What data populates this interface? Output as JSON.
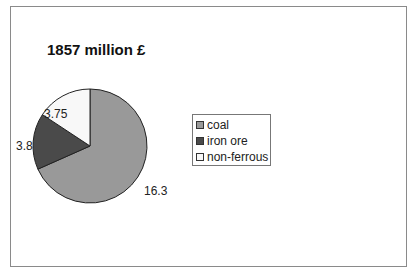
{
  "chart_data": {
    "type": "pie",
    "title": "1857 million £",
    "categories": [
      "coal",
      "iron ore",
      "non-ferrous"
    ],
    "values": [
      16.3,
      3.8,
      3.75
    ],
    "colors": [
      "#999999",
      "#4a4a4a",
      "#f8f8f8"
    ],
    "data_labels": [
      "16.3",
      "3.8",
      "3.75"
    ],
    "legend_position": "right",
    "start_angle_deg": 0,
    "direction": "clockwise"
  },
  "legend": {
    "items": [
      {
        "label": "coal",
        "color": "#999999"
      },
      {
        "label": "iron ore",
        "color": "#4a4a4a"
      },
      {
        "label": "non-ferrous",
        "color": "#f8f8f8"
      }
    ]
  }
}
